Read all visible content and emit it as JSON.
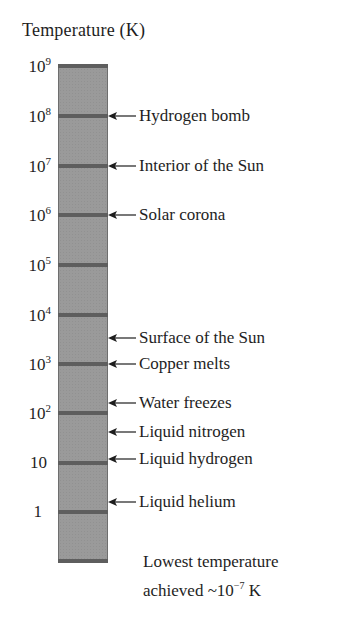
{
  "chart_data": {
    "type": "diagram",
    "title": "Temperature (K)",
    "scale": "logarithmic",
    "axis_ticks": [
      {
        "label_base": "10",
        "label_exp": "9",
        "value": 1000000000,
        "y": 66
      },
      {
        "label_base": "10",
        "label_exp": "8",
        "value": 100000000,
        "y": 116
      },
      {
        "label_base": "10",
        "label_exp": "7",
        "value": 10000000,
        "y": 166
      },
      {
        "label_base": "10",
        "label_exp": "6",
        "value": 1000000,
        "y": 215
      },
      {
        "label_base": "10",
        "label_exp": "5",
        "value": 100000,
        "y": 265
      },
      {
        "label_base": "10",
        "label_exp": "4",
        "value": 10000,
        "y": 315
      },
      {
        "label_base": "10",
        "label_exp": "3",
        "value": 1000,
        "y": 364
      },
      {
        "label_base": "10",
        "label_exp": "2",
        "value": 100,
        "y": 413
      },
      {
        "label_base": "10",
        "label_exp": "",
        "value": 10,
        "y": 463
      },
      {
        "label_base": "1",
        "label_exp": "",
        "value": 1,
        "y": 512
      }
    ],
    "annotations": [
      {
        "text": "Hydrogen bomb",
        "approx_K": 100000000,
        "y": 116
      },
      {
        "text": "Interior of the Sun",
        "approx_K": 10000000,
        "y": 166
      },
      {
        "text": "Solar corona",
        "approx_K": 1000000,
        "y": 215
      },
      {
        "text": "Surface of the Sun",
        "approx_K": 5800,
        "y": 338
      },
      {
        "text": "Copper melts",
        "approx_K": 1358,
        "y": 364
      },
      {
        "text": "Water freezes",
        "approx_K": 273,
        "y": 403
      },
      {
        "text": "Liquid nitrogen",
        "approx_K": 77,
        "y": 432
      },
      {
        "text": "Liquid hydrogen",
        "approx_K": 20,
        "y": 459
      },
      {
        "text": "Liquid helium",
        "approx_K": 4,
        "y": 502
      }
    ],
    "footnote": {
      "line1": "Lowest temperature",
      "line2_prefix": "achieved ~10",
      "line2_exp": "−7",
      "line2_suffix": " K"
    }
  },
  "colors": {
    "bar_fill": "#9a9a9a",
    "tick": "#5e5e5e",
    "text": "#1e1e1e"
  }
}
